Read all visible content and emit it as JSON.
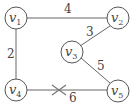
{
  "graph": {
    "nodes": [
      {
        "id": "v1",
        "label": "v",
        "sub": "1"
      },
      {
        "id": "v2",
        "label": "v",
        "sub": "2"
      },
      {
        "id": "v3",
        "label": "v",
        "sub": "3"
      },
      {
        "id": "v4",
        "label": "v",
        "sub": "4"
      },
      {
        "id": "v5",
        "label": "v",
        "sub": "5"
      }
    ],
    "edges": [
      {
        "from": "v1",
        "to": "v2",
        "weight": "4"
      },
      {
        "from": "v1",
        "to": "v4",
        "weight": "2"
      },
      {
        "from": "v2",
        "to": "v3",
        "weight": "3"
      },
      {
        "from": "v3",
        "to": "v5",
        "weight": "5"
      },
      {
        "from": "v4",
        "to": "v5",
        "weight": "6",
        "crossed": true
      }
    ]
  }
}
